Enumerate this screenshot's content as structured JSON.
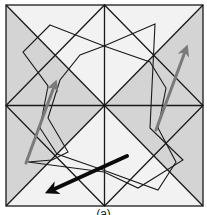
{
  "figure": {
    "colors": {
      "background": "#f2f2f2",
      "shade": "#d4d4d4",
      "line": "#1a1a1a",
      "arrow_gray": "#7a7a7a",
      "arrow_black": "#0a0a0a"
    },
    "outer_square": [
      6,
      5,
      203,
      206
    ],
    "center": [
      104.5,
      105.5
    ],
    "shaded_triangles": [
      [
        [
          6,
          5
        ],
        [
          6,
          105.5
        ],
        [
          55,
          55
        ]
      ],
      [
        [
          6,
          105.5
        ],
        [
          104.5,
          105.5
        ],
        [
          55,
          55
        ]
      ],
      [
        [
          203,
          5
        ],
        [
          203,
          105.5
        ],
        [
          154,
          55
        ]
      ],
      [
        [
          104.5,
          105.5
        ],
        [
          203,
          105.5
        ],
        [
          154,
          55
        ]
      ],
      [
        [
          6,
          105.5
        ],
        [
          6,
          206
        ],
        [
          55,
          156
        ]
      ],
      [
        [
          6,
          105.5
        ],
        [
          104.5,
          105.5
        ],
        [
          55,
          156
        ]
      ],
      [
        [
          203,
          105.5
        ],
        [
          203,
          206
        ],
        [
          154,
          156
        ]
      ],
      [
        [
          104.5,
          105.5
        ],
        [
          203,
          105.5
        ],
        [
          154,
          156
        ]
      ]
    ],
    "polygons": [
      [
        [
          50,
          25
        ],
        [
          104,
          46
        ],
        [
          150,
          62
        ],
        [
          166,
          88
        ],
        [
          158,
          128
        ],
        [
          176,
          162
        ],
        [
          158,
          190
        ],
        [
          103,
          170
        ],
        [
          57,
          154
        ],
        [
          40,
          128
        ],
        [
          48,
          86
        ],
        [
          23,
          52
        ]
      ],
      [
        [
          155,
          24
        ],
        [
          104,
          46
        ],
        [
          80,
          55
        ],
        [
          60,
          80
        ],
        [
          48,
          118
        ],
        [
          68,
          152
        ],
        [
          52,
          160
        ],
        [
          28,
          162
        ],
        [
          104,
          172
        ],
        [
          138,
          188
        ],
        [
          183,
          160
        ],
        [
          150,
          128
        ]
      ]
    ],
    "arrows": [
      {
        "name": "left-gray-arrow",
        "from": [
          26,
          163
        ],
        "to": [
          55,
          84
        ],
        "color": "#7a7a7a",
        "width": 3
      },
      {
        "name": "right-gray-arrow",
        "from": [
          156,
          130
        ],
        "to": [
          186,
          49
        ],
        "color": "#7a7a7a",
        "width": 3
      },
      {
        "name": "bottom-black-arrow",
        "from": [
          127,
          156
        ],
        "to": [
          50,
          191
        ],
        "color": "#0a0a0a",
        "width": 4
      }
    ],
    "caption": "(a)"
  }
}
